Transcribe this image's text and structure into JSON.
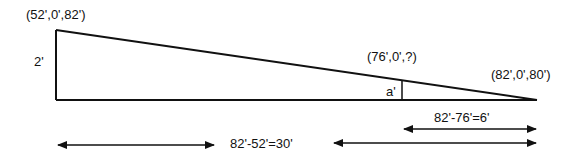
{
  "diagram": {
    "type": "slope-triangle-elevation",
    "colors": {
      "stroke": "#111111",
      "background": "#ffffff"
    },
    "points": {
      "high_end": {
        "label": "(52',0',82')"
      },
      "mid_point": {
        "label": "(76',0',?)"
      },
      "low_end": {
        "label": "(82',0',80')"
      }
    },
    "heights": {
      "left_height": {
        "label": "2'"
      },
      "unknown_height": {
        "label": "a'"
      }
    },
    "dimensions": {
      "total_run": {
        "label": "82'-52'=30'"
      },
      "partial_run": {
        "label": "82'-76'=6'"
      }
    }
  }
}
